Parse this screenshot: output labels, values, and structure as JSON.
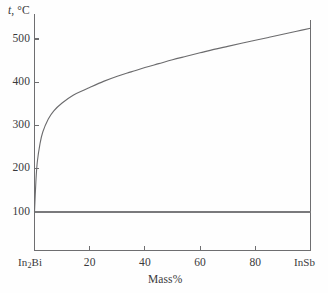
{
  "chart_data": {
    "type": "line",
    "title": "",
    "subtitle": "",
    "xlabel": "Mass%",
    "ylabel": "t, °C",
    "ylabel_symbol": "t",
    "ylabel_unit": ", °C",
    "xlim": [
      0,
      100
    ],
    "ylim": [
      72,
      545
    ],
    "grid": false,
    "legend": false,
    "legend_position": "none",
    "y_ticks": [
      100,
      200,
      300,
      400,
      500
    ],
    "y_tick_labels": [
      "100",
      "200",
      "300",
      "400",
      "500"
    ],
    "x_ticks": [
      0,
      20,
      40,
      60,
      80,
      100
    ],
    "x_tick_labels": [
      "In₂Bi",
      "20",
      "40",
      "60",
      "80",
      "InSb"
    ],
    "x_endmember_left": "In₂Bi",
    "x_endmember_left_formula": [
      "In",
      "2",
      "Bi"
    ],
    "x_endmember_right": "InSb",
    "axis_color": "#6e6e70",
    "curve_color": "#6b6b6d",
    "series": [
      {
        "name": "liquidus",
        "style": "solid",
        "x": [
          0,
          0.5,
          1,
          2,
          3,
          5,
          7,
          10,
          14,
          18,
          20,
          25,
          30,
          35,
          40,
          45,
          50,
          55,
          60,
          65,
          70,
          75,
          80,
          85,
          90,
          95,
          100
        ],
        "values": [
          100,
          170,
          215,
          258,
          285,
          315,
          334,
          352,
          370,
          382,
          388,
          402,
          414,
          424,
          434,
          443,
          452,
          460,
          468,
          476,
          483,
          490,
          497,
          504,
          511,
          518,
          525
        ]
      },
      {
        "name": "eutectic-horizontal",
        "style": "solid",
        "x": [
          0,
          100
        ],
        "values": [
          100,
          100
        ]
      }
    ],
    "annotations": []
  },
  "figure": {
    "background_color": "#fefefe"
  }
}
